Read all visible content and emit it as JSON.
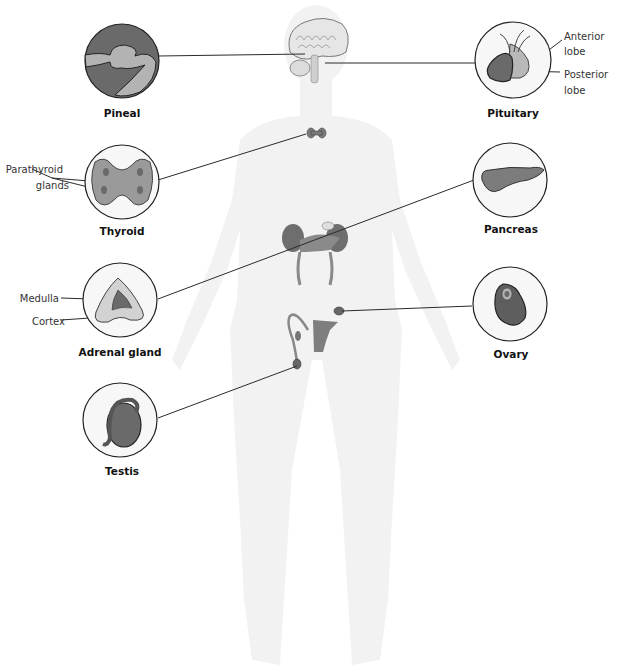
{
  "diagram": {
    "title_partial": "",
    "body": {
      "silhouette_color": "#f1f1f1"
    },
    "colors": {
      "organ_dark": "#5e5e5e",
      "organ_mid": "#8c8c8c",
      "organ_light": "#bdbdbd",
      "circle_fill": "#f7f7f7",
      "line": "#2b2b2b"
    },
    "glands": [
      {
        "id": "pineal",
        "label": "Pineal",
        "sublabels": []
      },
      {
        "id": "pituitary",
        "label": "Pituitary",
        "sublabels": [
          "Anterior",
          "lobe",
          "Posterior",
          "lobe"
        ]
      },
      {
        "id": "thyroid",
        "label": "Thyroid",
        "sublabels": [
          "Parathyroid",
          "glands"
        ]
      },
      {
        "id": "pancreas",
        "label": "Pancreas",
        "sublabels": []
      },
      {
        "id": "adrenal",
        "label": "Adrenal gland",
        "sublabels": [
          "Medulla",
          "Cortex"
        ]
      },
      {
        "id": "ovary",
        "label": "Ovary",
        "sublabels": []
      },
      {
        "id": "testis",
        "label": "Testis",
        "sublabels": []
      }
    ]
  }
}
